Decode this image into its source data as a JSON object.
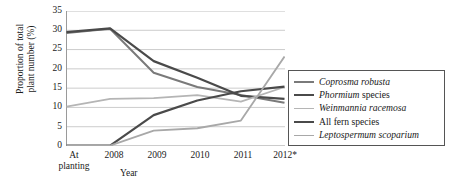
{
  "chart_data": {
    "type": "line",
    "title": "",
    "xlabel": "Year",
    "ylabel": "Proportion of total plant number (%)",
    "ylabel_line1": "Proportion of total",
    "ylabel_line2": "plant number (%)",
    "categories": [
      "At planting",
      "2008",
      "2009",
      "2010",
      "2011",
      "2012*"
    ],
    "category_lines": [
      [
        "At",
        "planting"
      ],
      [
        "2008"
      ],
      [
        "2009"
      ],
      [
        "2010"
      ],
      [
        "2011"
      ],
      [
        "2012*"
      ]
    ],
    "yticks": [
      0,
      5,
      10,
      15,
      20,
      25,
      30,
      35
    ],
    "ylim": [
      0,
      35
    ],
    "grid": "horizontal",
    "legend_position": "right",
    "series": [
      {
        "name": "Coprosma robusta",
        "name_italic": "Coprosma robusta",
        "color": "#7a7a7a",
        "width": 2.0,
        "values": [
          29.3,
          30.4,
          19.0,
          15.3,
          13.2,
          11.2
        ]
      },
      {
        "name": "Phormium species",
        "name_italic": "Phormium",
        "name_roman": " species",
        "color": "#4a4a4a",
        "width": 2.2,
        "values": [
          29.5,
          30.5,
          22.0,
          17.7,
          13.0,
          12.2
        ]
      },
      {
        "name": "Weinmannia racemosa",
        "name_italic": "Weinmannia racemosa",
        "color": "#b5b5b5",
        "width": 1.8,
        "values": [
          10.2,
          12.2,
          12.4,
          13.2,
          11.5,
          15.3
        ]
      },
      {
        "name": "All fern species",
        "name_roman": "All fern species",
        "color": "#4a4a4a",
        "width": 2.2,
        "values": [
          0.1,
          0.1,
          8.0,
          11.8,
          14.2,
          15.4
        ]
      },
      {
        "name": "Leptospermum scoparium",
        "name_italic": "Leptospermum scoparium",
        "color": "#a8a8a8",
        "width": 1.8,
        "values": [
          0.1,
          0.1,
          4.0,
          4.6,
          6.6,
          23.2
        ]
      }
    ]
  },
  "axis": {
    "x_title": "Year"
  }
}
